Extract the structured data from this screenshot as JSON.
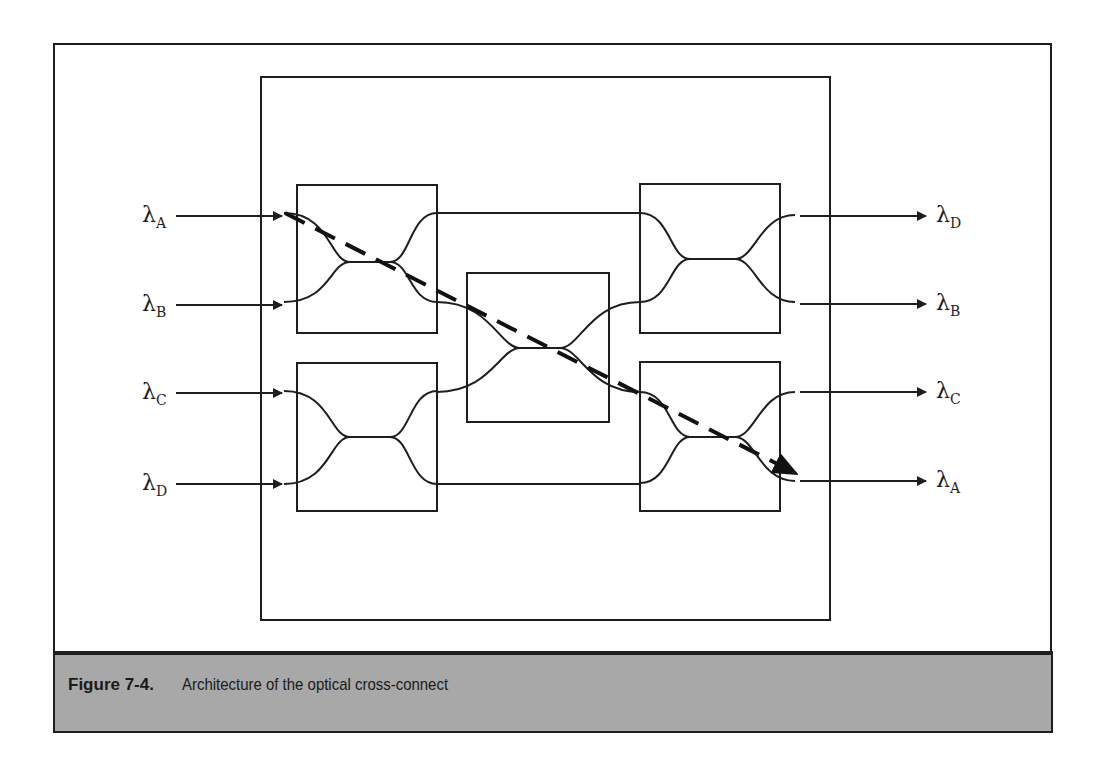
{
  "figure": {
    "number": "Figure 7-4.",
    "caption": "Architecture of the optical cross-connect"
  },
  "inputs": [
    {
      "symbol": "λ",
      "sub": "A"
    },
    {
      "symbol": "λ",
      "sub": "B"
    },
    {
      "symbol": "λ",
      "sub": "C"
    },
    {
      "symbol": "λ",
      "sub": "D"
    }
  ],
  "outputs": [
    {
      "symbol": "λ",
      "sub": "D"
    },
    {
      "symbol": "λ",
      "sub": "B"
    },
    {
      "symbol": "λ",
      "sub": "C"
    },
    {
      "symbol": "λ",
      "sub": "A"
    }
  ],
  "nodes": [
    {
      "id": "switch-top-left",
      "label": "2x2 coupler"
    },
    {
      "id": "switch-bottom-left",
      "label": "2x2 coupler"
    },
    {
      "id": "switch-middle",
      "label": "2x2 coupler"
    },
    {
      "id": "switch-top-right",
      "label": "2x2 coupler"
    },
    {
      "id": "switch-bottom-right",
      "label": "2x2 coupler"
    }
  ],
  "highlighted_path": {
    "from": "λA input",
    "to": "λA output",
    "style": "dashed-arrow"
  },
  "colors": {
    "line": "#1e1e1e",
    "caption_bg": "#a8a8a8",
    "background": "#ffffff"
  }
}
